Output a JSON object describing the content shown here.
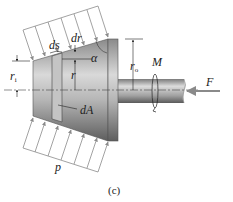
{
  "figure": {
    "caption": "(c)",
    "labels": {
      "ds": "ds",
      "dr": "dr",
      "alpha": "α",
      "r_i": "r",
      "r_i_sub": "i",
      "r": "r",
      "r_o": "r",
      "r_o_sub": "o",
      "M": "M",
      "F": "F",
      "dA": "dA",
      "p": "p"
    },
    "colors": {
      "cone_dark": "#6e6e6e",
      "cone_light": "#d8d8d8",
      "strip": "#bdbdbd",
      "arrow": "#8a8a8a",
      "text": "#222222"
    }
  }
}
